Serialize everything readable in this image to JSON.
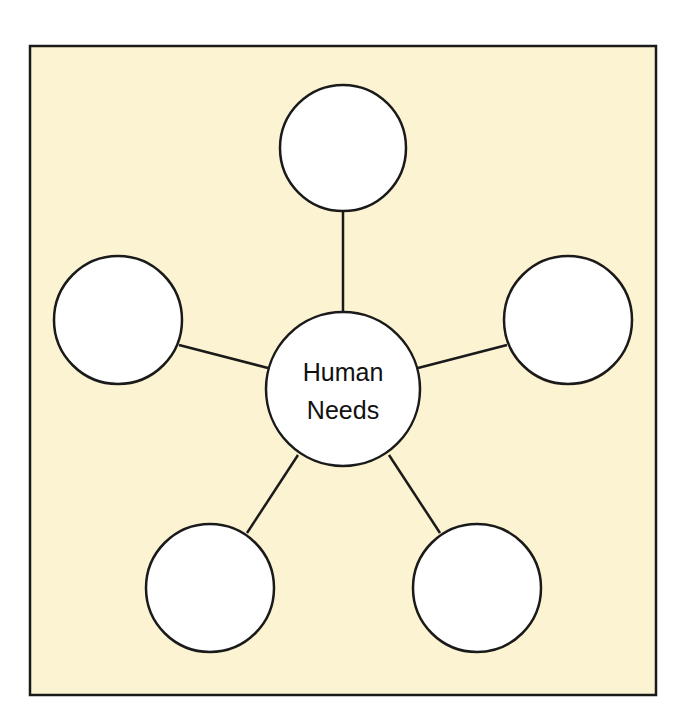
{
  "diagram": {
    "type": "concept-web",
    "colors": {
      "background": "#fbf3d2",
      "border": "#1a1a1a",
      "node_fill": "#ffffff",
      "stroke": "#1a1a1a"
    },
    "center_node": {
      "label_line1": "Human",
      "label_line2": "Needs"
    },
    "outer_nodes": [
      {
        "position": "top",
        "label": ""
      },
      {
        "position": "left",
        "label": ""
      },
      {
        "position": "right",
        "label": ""
      },
      {
        "position": "bottom-left",
        "label": ""
      },
      {
        "position": "bottom-right",
        "label": ""
      }
    ]
  }
}
